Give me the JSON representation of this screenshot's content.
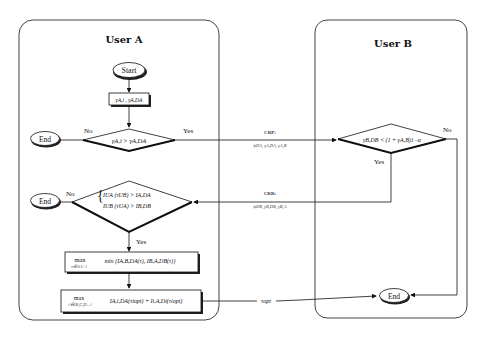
{
  "panels": {
    "user_a": {
      "title": "User A"
    },
    "user_b": {
      "title": "User B"
    }
  },
  "nodes": {
    "start": {
      "label": "Start"
    },
    "compute": {
      "label": "γA,i , γA,DA"
    },
    "decision1": {
      "label": "γA,i > γA,DA",
      "no": "No",
      "yes": "Yes"
    },
    "end1": {
      "label": "End"
    },
    "decision2": {
      "line1": "IUA (τUB) > IA,DA",
      "line2": "IUB (τUA) > IB,DB",
      "no": "No",
      "yes": "Yes"
    },
    "end2": {
      "label": "End"
    },
    "optimize": {
      "max_label": "max",
      "max_sub": "τ∈ΛA+i",
      "expr": "min {IA,B,DA(τ), IB,A,DB(τ)}"
    },
    "select": {
      "max_label": "max",
      "max_sub": "i∈{B,C,D...}",
      "expr": "IA,i,DA(τiopt) + Ii,A,Di(τiopt)"
    },
    "decision_b": {
      "label": "γB,DB < (1 + γA,B)1−α",
      "no": "No",
      "yes": "Yes"
    },
    "end_b": {
      "label": "End"
    }
  },
  "edges": {
    "crp": {
      "title": "CRP:",
      "params": "ϕDA, γA,DA, γA,B"
    },
    "crr": {
      "title": "CRR:",
      "params": "ϕDB, γB,DB, γB,A"
    },
    "topt": {
      "label": "τopt"
    }
  }
}
